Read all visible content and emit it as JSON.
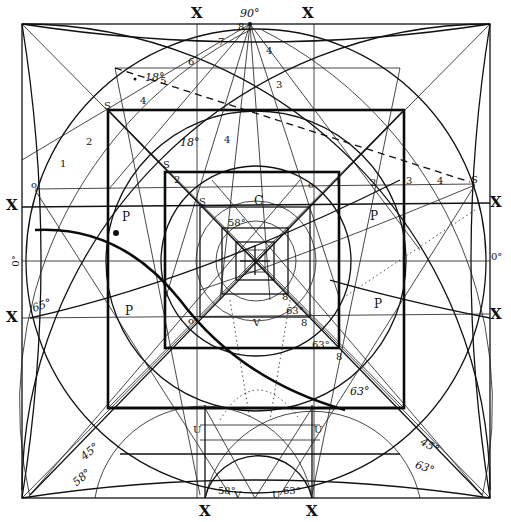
{
  "diagram": {
    "edge_labels": {
      "top_left_x": "X",
      "top_right_x": "X",
      "top_angle": "90°",
      "left_upper_x": "X",
      "left_lower_x": "X",
      "left_zero": "0°",
      "right_upper_x": "X",
      "right_lower_x": "X",
      "right_zero": "0°",
      "bottom_left_x": "X",
      "bottom_right_x": "X"
    },
    "angle_labels": {
      "top_18": "18°",
      "inner_18": "18°",
      "left_65": "65°",
      "bl_45": "45°",
      "bl_58": "58°",
      "br_45": "45°",
      "br_63": "63°",
      "mid_63": "63°",
      "center_63a": "63°",
      "center_63b": "63°",
      "center_58": "58°",
      "bottom_58": "58°",
      "bottom_63": "63°"
    },
    "point_labels": {
      "P_left_upper": "P",
      "P_right_upper": "P",
      "P_left_lower": "P",
      "P_right_lower": "P",
      "S_outer": "S",
      "S_mid": "S",
      "S_inner": "S",
      "S_right": "S",
      "C_center": "C",
      "B_inner": "8",
      "B_mid": "8",
      "B_outer": "8",
      "U_left": "U",
      "U_right": "U",
      "V_bottom": "V",
      "U_bottom": "U",
      "V_center": "V",
      "o_left": "o",
      "o_right": "o",
      "o_inner": "o"
    },
    "scale_numbers": {
      "top_1": "1",
      "top_2": "2",
      "top_3": "3",
      "top_4": "4",
      "top_5": "5",
      "top_6": "6",
      "top_7": "7",
      "top_8": "8",
      "left_1": "1",
      "left_2": "2",
      "left_3": "3",
      "left_4": "4",
      "right_1": "1",
      "right_2": "2",
      "right_3": "3",
      "right_4": "4",
      "right_5": "5",
      "inner_4": "4",
      "inner_3": "3",
      "inner_2": "2"
    }
  }
}
